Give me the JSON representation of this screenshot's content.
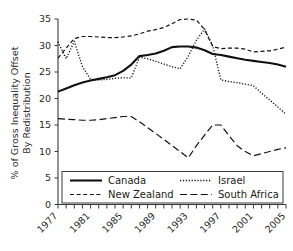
{
  "chart_data": {
    "type": "line",
    "title": "",
    "xlabel": "",
    "ylabel": "% of Gross Inequality Offset By Redistribution",
    "ylabel_line1": "% of Gross Inequality Offset",
    "ylabel_line2": "By Redistribution",
    "ylim": [
      0,
      35
    ],
    "yticks": [
      0,
      5,
      10,
      15,
      20,
      25,
      30,
      35
    ],
    "ytick_labels": [
      "0",
      "5",
      "10",
      "15",
      "20",
      "25",
      "30",
      "35"
    ],
    "xlim": [
      1977,
      2005
    ],
    "xticks_all": [
      1977,
      1978,
      1979,
      1980,
      1981,
      1982,
      1983,
      1984,
      1985,
      1986,
      1987,
      1988,
      1989,
      1990,
      1991,
      1992,
      1993,
      1994,
      1995,
      1996,
      1997,
      1998,
      1999,
      2000,
      2001,
      2002,
      2003,
      2004,
      2005
    ],
    "xtick_labels": [
      "1977",
      "1981",
      "1985",
      "1989",
      "1993",
      "1997",
      "2001",
      "2005"
    ],
    "xtick_label_years": [
      1977,
      1981,
      1985,
      1989,
      1993,
      1997,
      2001,
      2005
    ],
    "grid": false,
    "legend_position": "bottom-inside",
    "x": [
      1977,
      1978,
      1979,
      1980,
      1981,
      1982,
      1983,
      1984,
      1985,
      1986,
      1987,
      1988,
      1989,
      1990,
      1991,
      1992,
      1993,
      1994,
      1995,
      1996,
      1997,
      1998,
      1999,
      2000,
      2001,
      2002,
      2003,
      2004,
      2005
    ],
    "series": [
      {
        "name": "Canada",
        "style": "solid",
        "color": "#111111",
        "values": [
          21.3,
          21.9,
          22.5,
          23.0,
          23.4,
          23.7,
          24.0,
          24.4,
          25.2,
          26.4,
          28.0,
          28.2,
          28.5,
          29.0,
          29.7,
          29.8,
          29.8,
          29.6,
          29.1,
          28.4,
          28.2,
          27.9,
          27.6,
          27.3,
          27.1,
          26.9,
          26.7,
          26.4,
          26.0
        ]
      },
      {
        "name": "Israel",
        "style": "dotted",
        "color": "#111111",
        "values": [
          30.7,
          27.5,
          30.8,
          26.0,
          23.6,
          23.5,
          23.6,
          23.8,
          23.9,
          23.9,
          27.8,
          27.5,
          27.0,
          26.5,
          26.0,
          25.6,
          28.0,
          31.0,
          33.1,
          30.0,
          23.5,
          23.2,
          23.0,
          22.7,
          22.4,
          21.0,
          19.7,
          18.4,
          17.0
        ]
      },
      {
        "name": "New Zealand",
        "style": "short-dash",
        "color": "#111111",
        "values": [
          27.6,
          29.5,
          31.3,
          31.7,
          31.7,
          31.6,
          31.5,
          31.5,
          31.6,
          31.8,
          32.2,
          32.7,
          33.0,
          33.4,
          34.1,
          34.9,
          35.0,
          34.8,
          33.0,
          29.8,
          29.4,
          29.5,
          29.5,
          29.3,
          28.8,
          28.9,
          29.0,
          29.3,
          29.7
        ]
      },
      {
        "name": "South Africa",
        "style": "long-dash",
        "color": "#111111",
        "values": [
          16.2,
          16.1,
          16.0,
          15.9,
          15.9,
          16.0,
          16.2,
          16.4,
          16.6,
          16.6,
          15.6,
          14.5,
          13.4,
          12.3,
          11.1,
          10.0,
          8.8,
          11.1,
          13.1,
          15.0,
          15.0,
          13.0,
          11.1,
          10.0,
          9.2,
          9.6,
          10.0,
          10.4,
          10.7
        ]
      }
    ]
  },
  "legend": {
    "entries": [
      {
        "label": "Canada",
        "style": "solid"
      },
      {
        "label": "Israel",
        "style": "dotted"
      },
      {
        "label": "New Zealand",
        "style": "short-dash"
      },
      {
        "label": "South Africa",
        "style": "long-dash"
      }
    ]
  }
}
